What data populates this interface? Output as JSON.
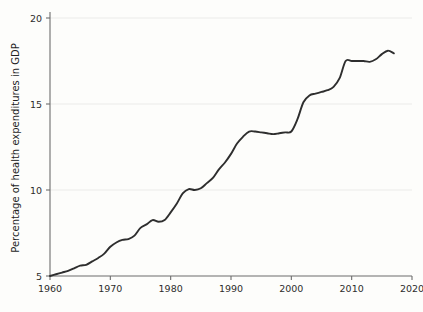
{
  "chart_data": {
    "type": "line",
    "title": "",
    "subtitle": "",
    "xlabel": "",
    "ylabel": "Percentage of health expenditures in GDP",
    "xlim": [
      1960,
      2020
    ],
    "ylim": [
      4.2,
      20.4
    ],
    "grid": true,
    "grid_axis": "y",
    "legend": false,
    "legend_position": "none",
    "line_color": "#2e2e2e",
    "axis_color": "#6d6d6d",
    "grid_color": "#e9e9e6",
    "background_color": "#fdfdfb",
    "xticks": [
      1960,
      1970,
      1980,
      1990,
      2000,
      2010,
      2020
    ],
    "xticklabels": [
      "1960",
      "1970",
      "1980",
      "1990",
      "2000",
      "2010",
      "2020"
    ],
    "yticks": [
      5,
      10,
      15,
      20
    ],
    "yticklabels": [
      "5",
      "10",
      "15",
      "20"
    ],
    "series": [
      {
        "name": "Health expenditures share of GDP",
        "x": [
          1960,
          1961,
          1962,
          1963,
          1964,
          1965,
          1966,
          1967,
          1968,
          1969,
          1970,
          1971,
          1972,
          1973,
          1974,
          1975,
          1976,
          1977,
          1978,
          1979,
          1980,
          1981,
          1982,
          1983,
          1984,
          1985,
          1986,
          1987,
          1988,
          1989,
          1990,
          1991,
          1992,
          1993,
          1994,
          1995,
          1996,
          1997,
          1998,
          1999,
          2000,
          2001,
          2002,
          2003,
          2004,
          2005,
          2006,
          2007,
          2008,
          2009,
          2010,
          2011,
          2012,
          2013,
          2014,
          2015,
          2016,
          2017
        ],
        "values": [
          5.0,
          5.1,
          5.2,
          5.3,
          5.45,
          5.6,
          5.65,
          5.85,
          6.05,
          6.3,
          6.7,
          6.95,
          7.1,
          7.15,
          7.35,
          7.8,
          8.0,
          8.25,
          8.15,
          8.25,
          8.7,
          9.2,
          9.8,
          10.05,
          10.0,
          10.1,
          10.4,
          10.7,
          11.2,
          11.6,
          12.1,
          12.7,
          13.1,
          13.4,
          13.4,
          13.35,
          13.3,
          13.25,
          13.3,
          13.35,
          13.4,
          14.1,
          15.1,
          15.5,
          15.6,
          15.7,
          15.8,
          16.0,
          16.5,
          17.5,
          17.5,
          17.5,
          17.5,
          17.45,
          17.6,
          17.9,
          18.1,
          17.95
        ]
      }
    ]
  },
  "axes": {
    "y_axis_title": "Percentage of health expenditures in GDP"
  }
}
